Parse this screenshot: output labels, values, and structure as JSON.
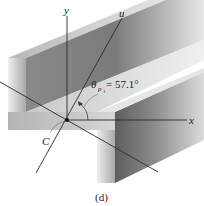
{
  "figure": {
    "caption": "(d)"
  },
  "labels": {
    "y_axis": "y",
    "u_axis": "u",
    "x_axis": "x",
    "centroid": "C",
    "theta_symbol": "θ",
    "theta_subscript": "p",
    "theta_subsubscript": "1",
    "theta_value": " = 57.1°"
  },
  "colors": {
    "background": "#ffffff",
    "axis_line": "#2a2a2a",
    "face_dark": "#7d7d7d",
    "face_light": "#d9d9d9"
  }
}
